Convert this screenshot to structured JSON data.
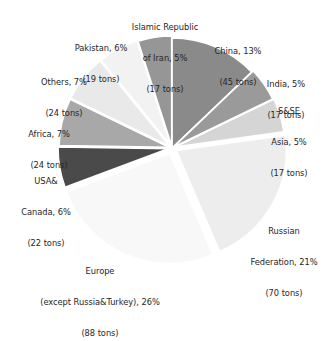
{
  "chart_data": {
    "type": "pie",
    "title": "",
    "unit": "tons",
    "total_tons": 343,
    "legend_position": "outside-labels",
    "grid": false,
    "start_angle_deg": 0,
    "direction": "clockwise",
    "categories": [
      "China",
      "India",
      "S&SE Asia",
      "Russian Federation",
      "Europe (except Russia&Turkey)",
      "USA&Canada",
      "Africa",
      "Others",
      "Pakistan",
      "Islamic Republic of Iran"
    ],
    "values": [
      13,
      5,
      5,
      21,
      26,
      6,
      7,
      7,
      6,
      5
    ],
    "tons": [
      45,
      17,
      17,
      70,
      88,
      22,
      24,
      24,
      19,
      17
    ],
    "colors": [
      "#8a8a8a",
      "#9a9a9a",
      "#d5d5d5",
      "#ededed",
      "#f8f8f8",
      "#4a4a4a",
      "#a8a8a8",
      "#e9e9e9",
      "#f2f2f2",
      "#969696"
    ],
    "slices": [
      {
        "name": "China",
        "percent": 13,
        "tons": 45,
        "color": "#8a8a8a",
        "label_line1": "China, 13%",
        "label_line2": "(45 tons)"
      },
      {
        "name": "India",
        "percent": 5,
        "tons": 17,
        "color": "#9a9a9a",
        "label_line1": "India, 5%",
        "label_line2": "(17 tons)"
      },
      {
        "name": "S&SE Asia",
        "percent": 5,
        "tons": 17,
        "color": "#d5d5d5",
        "label_line1": "S&SE",
        "label_line2": "Asia, 5%",
        "label_line3": "(17 tons)"
      },
      {
        "name": "Russian Federation",
        "percent": 21,
        "tons": 70,
        "color": "#ededed",
        "label_line1": "Russian",
        "label_line2": "Federation, 21%",
        "label_line3": "(70 tons)"
      },
      {
        "name": "Europe (except Russia&Turkey)",
        "percent": 26,
        "tons": 88,
        "color": "#f8f8f8",
        "label_line1": "Europe",
        "label_line2": "(except Russia&Turkey), 26%",
        "label_line3": "(88 tons)"
      },
      {
        "name": "USA&Canada",
        "percent": 6,
        "tons": 22,
        "color": "#4a4a4a",
        "label_line1": "USA&",
        "label_line2": "Canada, 6%",
        "label_line3": "(22 tons)"
      },
      {
        "name": "Africa",
        "percent": 7,
        "tons": 24,
        "color": "#a8a8a8",
        "label_line1": "Africa, 7%",
        "label_line2": "(24 tons)"
      },
      {
        "name": "Others",
        "percent": 7,
        "tons": 24,
        "color": "#e9e9e9",
        "label_line1": "Others, 7%",
        "label_line2": "(24 tons)"
      },
      {
        "name": "Pakistan",
        "percent": 6,
        "tons": 19,
        "color": "#f2f2f2",
        "label_line1": "Pakistan, 6%",
        "label_line2": "(19 tons)"
      },
      {
        "name": "Islamic Republic of Iran",
        "percent": 5,
        "tons": 17,
        "color": "#969696",
        "label_line1": "Islamic Republic",
        "label_line2": "of Iran, 5%",
        "label_line3": "(17 tons)"
      }
    ]
  }
}
